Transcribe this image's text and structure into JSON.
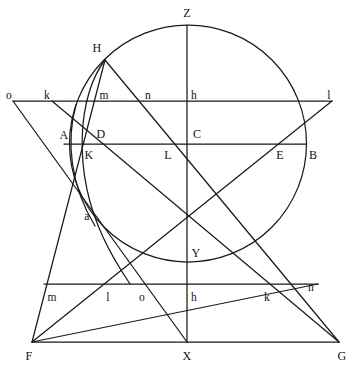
{
  "figure": {
    "background_color": "#ffffff",
    "stroke_color": "#1a1a1a",
    "stroke_width": 1.25,
    "width": 358,
    "height": 367
  },
  "labels": [
    {
      "id": "Z",
      "text": "Z",
      "x": 187,
      "y": 13,
      "size": "upper"
    },
    {
      "id": "H",
      "text": "H",
      "x": 97,
      "y": 48,
      "size": "upper"
    },
    {
      "id": "o1",
      "text": "o",
      "x": 9,
      "y": 96,
      "size": "lower"
    },
    {
      "id": "k1",
      "text": "k",
      "x": 47,
      "y": 96,
      "size": "lower"
    },
    {
      "id": "m1",
      "text": "m",
      "x": 104,
      "y": 96,
      "size": "lower"
    },
    {
      "id": "n1",
      "text": "n",
      "x": 148,
      "y": 96,
      "size": "lower"
    },
    {
      "id": "h1",
      "text": "h",
      "x": 194,
      "y": 96,
      "size": "lower"
    },
    {
      "id": "l1",
      "text": "l",
      "x": 329,
      "y": 96,
      "size": "lower"
    },
    {
      "id": "A",
      "text": "A",
      "x": 64,
      "y": 135,
      "size": "upper"
    },
    {
      "id": "D",
      "text": "D",
      "x": 101,
      "y": 134,
      "size": "upper"
    },
    {
      "id": "C",
      "text": "C",
      "x": 197,
      "y": 134,
      "size": "upper"
    },
    {
      "id": "K",
      "text": "K",
      "x": 89,
      "y": 155,
      "size": "upper"
    },
    {
      "id": "L",
      "text": "L",
      "x": 168,
      "y": 155,
      "size": "upper"
    },
    {
      "id": "E",
      "text": "E",
      "x": 280,
      "y": 155,
      "size": "upper"
    },
    {
      "id": "B",
      "text": "B",
      "x": 313,
      "y": 155,
      "size": "upper"
    },
    {
      "id": "a",
      "text": "a",
      "x": 87,
      "y": 217,
      "size": "lower"
    },
    {
      "id": "Y",
      "text": "Y",
      "x": 196,
      "y": 253,
      "size": "upper"
    },
    {
      "id": "m2",
      "text": "m",
      "x": 52,
      "y": 298,
      "size": "lower"
    },
    {
      "id": "l2",
      "text": "l",
      "x": 108,
      "y": 298,
      "size": "lower"
    },
    {
      "id": "o2",
      "text": "o",
      "x": 142,
      "y": 298,
      "size": "lower"
    },
    {
      "id": "h2",
      "text": "h",
      "x": 194,
      "y": 298,
      "size": "lower"
    },
    {
      "id": "k2",
      "text": "k",
      "x": 267,
      "y": 298,
      "size": "lower"
    },
    {
      "id": "n2",
      "text": "n",
      "x": 311,
      "y": 288,
      "size": "lower"
    },
    {
      "id": "F",
      "text": "F",
      "x": 29,
      "y": 356,
      "size": "upper"
    },
    {
      "id": "X",
      "text": "X",
      "x": 187,
      "y": 356,
      "size": "upper"
    },
    {
      "id": "G",
      "text": "G",
      "x": 342,
      "y": 356,
      "size": "upper"
    }
  ],
  "geometry": {
    "circle": {
      "cx": 188,
      "cy": 143.5,
      "r": 118.5
    },
    "arc_H_to_bottom": "M 105,60 C 78,95 72,170 103,237 C 112,257 122,272 130,284",
    "arc_A_to_lower": "M 76,105 C 66,140 70,185 95,226",
    "segments": [
      {
        "name": "top-horizontal-o-l",
        "x1": 13,
        "y1": 101,
        "x2": 332,
        "y2": 101
      },
      {
        "name": "mid-horizontal-A-B",
        "x1": 64,
        "y1": 144,
        "x2": 306,
        "y2": 144
      },
      {
        "name": "low-horizontal-m-n",
        "x1": 44,
        "y1": 284,
        "x2": 318,
        "y2": 284
      },
      {
        "name": "base-horizontal-F-G",
        "x1": 32,
        "y1": 342,
        "x2": 339,
        "y2": 342
      },
      {
        "name": "vertical-Z-X",
        "x1": 187,
        "y1": 25,
        "x2": 187,
        "y2": 342
      },
      {
        "name": "H-to-G",
        "x1": 105,
        "y1": 60,
        "x2": 339,
        "y2": 342
      },
      {
        "name": "F-to-l",
        "x1": 32,
        "y1": 342,
        "x2": 332,
        "y2": 101
      },
      {
        "name": "k-to-G",
        "x1": 52,
        "y1": 101,
        "x2": 339,
        "y2": 342
      },
      {
        "name": "o-to-X",
        "x1": 13,
        "y1": 101,
        "x2": 187,
        "y2": 342
      },
      {
        "name": "H-to-F",
        "x1": 105,
        "y1": 60,
        "x2": 32,
        "y2": 342
      },
      {
        "name": "F-to-n",
        "x1": 32,
        "y1": 342,
        "x2": 318,
        "y2": 284
      }
    ]
  }
}
